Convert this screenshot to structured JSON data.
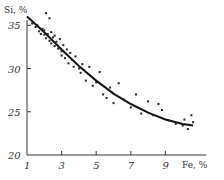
{
  "chart_data": {
    "type": "scatter",
    "title": "",
    "xlabel": "Fe, %",
    "ylabel": "Si, %",
    "xlim": [
      1,
      10.8
    ],
    "ylim": [
      20,
      37
    ],
    "x_ticks": [
      "1",
      "3",
      "5",
      "7",
      "9"
    ],
    "y_ticks": [
      "20",
      "25",
      "30",
      "35"
    ],
    "grid": false,
    "series": [
      {
        "name": "measurements",
        "kind": "scatter",
        "points": [
          [
            1.3,
            35.2
          ],
          [
            1.5,
            34.8
          ],
          [
            1.6,
            35.0
          ],
          [
            1.7,
            34.3
          ],
          [
            1.8,
            34.0
          ],
          [
            1.9,
            34.6
          ],
          [
            2.0,
            33.9
          ],
          [
            2.0,
            34.4
          ],
          [
            2.1,
            33.5
          ],
          [
            2.1,
            36.4
          ],
          [
            2.2,
            34.0
          ],
          [
            2.3,
            35.8
          ],
          [
            2.3,
            33.2
          ],
          [
            2.4,
            34.2
          ],
          [
            2.4,
            32.9
          ],
          [
            2.5,
            33.6
          ],
          [
            2.6,
            33.8
          ],
          [
            2.6,
            32.6
          ],
          [
            2.7,
            33.1
          ],
          [
            2.8,
            32.3
          ],
          [
            2.9,
            33.4
          ],
          [
            3.0,
            32.0
          ],
          [
            3.0,
            31.5
          ],
          [
            3.1,
            32.7
          ],
          [
            3.2,
            31.2
          ],
          [
            3.3,
            32.2
          ],
          [
            3.4,
            30.6
          ],
          [
            3.5,
            31.8
          ],
          [
            3.6,
            31.0
          ],
          [
            3.7,
            30.2
          ],
          [
            3.8,
            31.4
          ],
          [
            4.0,
            30.0
          ],
          [
            4.1,
            29.5
          ],
          [
            4.2,
            30.5
          ],
          [
            4.4,
            28.6
          ],
          [
            4.6,
            30.2
          ],
          [
            4.8,
            28.0
          ],
          [
            5.0,
            28.4
          ],
          [
            5.2,
            29.6
          ],
          [
            5.4,
            27.0
          ],
          [
            5.6,
            26.6
          ],
          [
            5.8,
            27.8
          ],
          [
            6.0,
            26.0
          ],
          [
            6.3,
            28.3
          ],
          [
            6.6,
            26.4
          ],
          [
            7.0,
            25.5
          ],
          [
            7.3,
            27.0
          ],
          [
            7.6,
            24.8
          ],
          [
            8.0,
            26.2
          ],
          [
            8.3,
            24.6
          ],
          [
            8.6,
            25.9
          ],
          [
            8.8,
            25.2
          ],
          [
            9.2,
            24.0
          ],
          [
            9.6,
            23.6
          ],
          [
            10.0,
            23.4
          ],
          [
            10.1,
            24.1
          ],
          [
            10.3,
            23.0
          ],
          [
            10.5,
            24.6
          ],
          [
            10.6,
            23.8
          ]
        ]
      },
      {
        "name": "fitted curve",
        "kind": "line",
        "points": [
          [
            1.0,
            36.0
          ],
          [
            2.0,
            34.2
          ],
          [
            3.0,
            32.2
          ],
          [
            4.0,
            30.3
          ],
          [
            5.0,
            28.6
          ],
          [
            6.0,
            27.1
          ],
          [
            7.0,
            25.9
          ],
          [
            8.0,
            24.9
          ],
          [
            9.0,
            24.1
          ],
          [
            10.0,
            23.6
          ],
          [
            10.6,
            23.4
          ]
        ]
      }
    ]
  },
  "labels": {
    "x_axis": "Fe, %",
    "y_axis": "Si, %"
  }
}
